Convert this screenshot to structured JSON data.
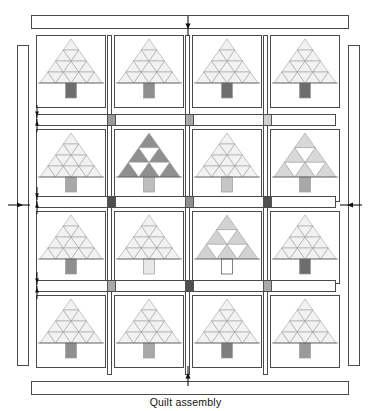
{
  "figure": {
    "caption": "Quilt assembly"
  },
  "palette": {
    "outline": "#4a4a4a",
    "tree_line": "#9a9a9a",
    "background": "#ffffff",
    "pale": "#f2f2f2",
    "light": "#e8e8e8",
    "medium_light": "#d8d8d8",
    "medium": "#bdbdbd",
    "dark": "#8f8f8f",
    "darker": "#6e6e6e",
    "darkest": "#4f4f4f"
  },
  "borders": [
    {
      "name": "top-border-strip",
      "label": "top border strip"
    },
    {
      "name": "bottom-border-strip",
      "label": "bottom border strip"
    },
    {
      "name": "left-border-strip",
      "label": "left border strip"
    },
    {
      "name": "right-border-strip",
      "label": "right border strip"
    }
  ],
  "grid": {
    "rows": 4,
    "columns": 4,
    "block_count": 16
  },
  "blocks": [
    {
      "row": 1,
      "col": 1,
      "name": "tree-block-r1c1",
      "tree_tiers": 4,
      "tree_fill": "#f2f2f2",
      "trunk_fill": "#6e6e6e",
      "pattern": "solid"
    },
    {
      "row": 1,
      "col": 2,
      "name": "tree-block-r1c2",
      "tree_tiers": 4,
      "tree_fill": "#f2f2f2",
      "trunk_fill": "#8f8f8f",
      "pattern": "solid"
    },
    {
      "row": 1,
      "col": 3,
      "name": "tree-block-r1c3",
      "tree_tiers": 4,
      "tree_fill": "#f2f2f2",
      "trunk_fill": "#6e6e6e",
      "pattern": "solid"
    },
    {
      "row": 1,
      "col": 4,
      "name": "tree-block-r1c4",
      "tree_tiers": 4,
      "tree_fill": "#f2f2f2",
      "trunk_fill": "#6e6e6e",
      "pattern": "solid"
    },
    {
      "row": 2,
      "col": 1,
      "name": "tree-block-r2c1",
      "tree_tiers": 4,
      "tree_fill": "#f2f2f2",
      "trunk_fill": "#a8a8a8",
      "pattern": "solid"
    },
    {
      "row": 2,
      "col": 2,
      "name": "tree-block-r2c2",
      "tree_tiers": 3,
      "tree_fill": "#8f8f8f",
      "trunk_fill": "#bdbdbd",
      "pattern": "sierpinski"
    },
    {
      "row": 2,
      "col": 3,
      "name": "tree-block-r2c3",
      "tree_tiers": 4,
      "tree_fill": "#f2f2f2",
      "trunk_fill": "#c6c6c6",
      "pattern": "solid"
    },
    {
      "row": 2,
      "col": 4,
      "name": "tree-block-r2c4",
      "tree_tiers": 3,
      "tree_fill": "#d8d8d8",
      "trunk_fill": "#a8a8a8",
      "pattern": "sierpinski"
    },
    {
      "row": 3,
      "col": 1,
      "name": "tree-block-r3c1",
      "tree_tiers": 4,
      "tree_fill": "#f2f2f2",
      "trunk_fill": "#8f8f8f",
      "pattern": "solid"
    },
    {
      "row": 3,
      "col": 2,
      "name": "tree-block-r3c2",
      "tree_tiers": 4,
      "tree_fill": "#f2f2f2",
      "trunk_fill": "#e8e8e8",
      "pattern": "solid"
    },
    {
      "row": 3,
      "col": 3,
      "name": "tree-block-r3c3",
      "tree_tiers": 3,
      "tree_fill": "#d2d2d2",
      "trunk_fill": "#ffffff",
      "pattern": "sierpinski"
    },
    {
      "row": 3,
      "col": 4,
      "name": "tree-block-r3c4",
      "tree_tiers": 4,
      "tree_fill": "#f2f2f2",
      "trunk_fill": "#6e6e6e",
      "pattern": "solid"
    },
    {
      "row": 4,
      "col": 1,
      "name": "tree-block-r4c1",
      "tree_tiers": 4,
      "tree_fill": "#f2f2f2",
      "trunk_fill": "#8f8f8f",
      "pattern": "solid"
    },
    {
      "row": 4,
      "col": 2,
      "name": "tree-block-r4c2",
      "tree_tiers": 4,
      "tree_fill": "#f2f2f2",
      "trunk_fill": "#a8a8a8",
      "pattern": "solid"
    },
    {
      "row": 4,
      "col": 3,
      "name": "tree-block-r4c3",
      "tree_tiers": 4,
      "tree_fill": "#f2f2f2",
      "trunk_fill": "#7d7d7d",
      "pattern": "solid"
    },
    {
      "row": 4,
      "col": 4,
      "name": "tree-block-r4c4",
      "tree_tiers": 4,
      "tree_fill": "#f2f2f2",
      "trunk_fill": "#9a9a9a",
      "pattern": "solid"
    }
  ],
  "sashing": {
    "horizontal_rows": [
      {
        "name": "horizontal-sashing-1",
        "squares": [
          "#9a9a9a",
          "#a8a8a8",
          "#d0d0d0"
        ]
      },
      {
        "name": "horizontal-sashing-2",
        "squares": [
          "#4f4f4f",
          "#8f8f8f",
          "#4f4f4f"
        ]
      },
      {
        "name": "horizontal-sashing-3",
        "squares": [
          "#a8a8a8",
          "#4f4f4f",
          "#a8a8a8"
        ]
      }
    ],
    "vertical_columns": 3
  },
  "arrows": [
    {
      "name": "arrow-top-center",
      "direction": "down"
    },
    {
      "name": "arrow-bottom-center",
      "direction": "up"
    },
    {
      "name": "arrow-left-border",
      "direction": "right"
    },
    {
      "name": "arrow-right-border",
      "direction": "left"
    },
    {
      "name": "arrow-sash-1-a",
      "direction": "down"
    },
    {
      "name": "arrow-sash-1-b",
      "direction": "up"
    },
    {
      "name": "arrow-sash-2-a",
      "direction": "down"
    },
    {
      "name": "arrow-sash-2-b",
      "direction": "up"
    },
    {
      "name": "arrow-sash-3-a",
      "direction": "down"
    },
    {
      "name": "arrow-sash-3-b",
      "direction": "up"
    }
  ]
}
